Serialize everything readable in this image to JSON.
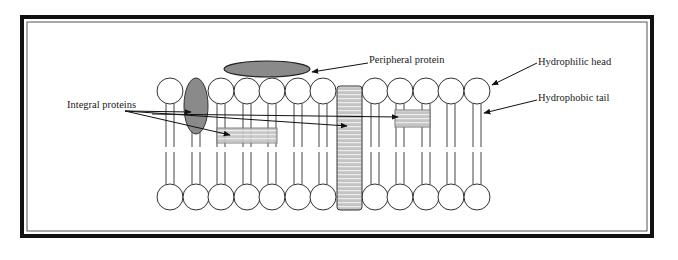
{
  "diagram": {
    "labels": {
      "peripheral_protein": "Peripheral protein",
      "hydrophilic_head": "Hydrophilic head",
      "hydrophobic_tail": "Hydrophobic tail",
      "integral_proteins": "Integral proteins"
    },
    "colors": {
      "frame": "#111111",
      "protein_fill": "#8a8a8a",
      "stripe_fill": "#c8c8c8",
      "stripe_line": "#e8e8e8",
      "line": "#333333",
      "background": "#ffffff"
    },
    "bilayer": {
      "top_head_centers_x": [
        170,
        221,
        247,
        272,
        298,
        323,
        375,
        400,
        426,
        451,
        477
      ],
      "bottom_head_centers_x": [
        170,
        196,
        221,
        247,
        272,
        298,
        323,
        375,
        400,
        426,
        451,
        477
      ],
      "head_radius": 13,
      "top_head_y": 91,
      "bottom_head_y": 197
    }
  }
}
